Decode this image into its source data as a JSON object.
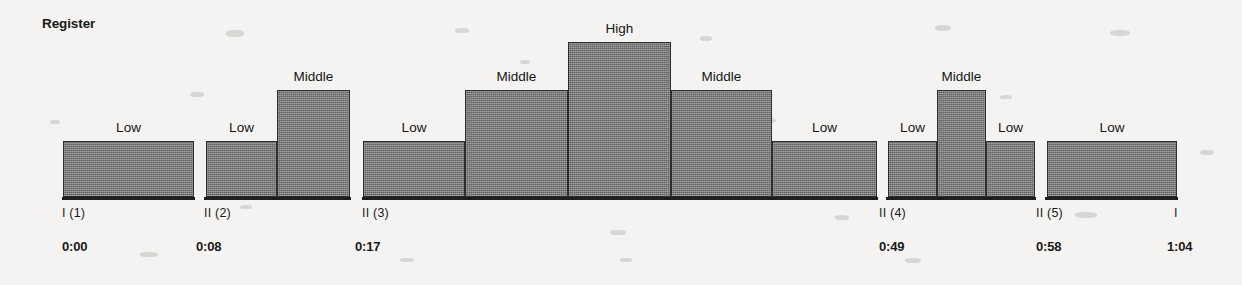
{
  "title": "Register",
  "chart_data": {
    "type": "bar",
    "title": "Register",
    "xlabel": "",
    "ylabel": "Register",
    "grid": false,
    "legend": "none",
    "level_scale": [
      "Low",
      "Middle",
      "High"
    ],
    "categories": [
      "I (1)",
      "II (2)",
      "II (3)",
      "II (4)",
      "II (5)",
      "I"
    ],
    "segments": [
      {
        "marker": "I (1)",
        "time": "0:00",
        "bars": [
          {
            "label": "Low",
            "level": 1
          }
        ]
      },
      {
        "marker": "II (2)",
        "time": "0:08",
        "bars": [
          {
            "label": "Low",
            "level": 1
          },
          {
            "label": "Middle",
            "level": 2
          }
        ]
      },
      {
        "marker": "II (3)",
        "time": "0:17",
        "bars": [
          {
            "label": "Low",
            "level": 1
          },
          {
            "label": "Middle",
            "level": 2
          },
          {
            "label": "High",
            "level": 3
          },
          {
            "label": "Middle",
            "level": 2
          },
          {
            "label": "Low",
            "level": 1
          }
        ]
      },
      {
        "marker": "II (4)",
        "time": "0:49",
        "bars": [
          {
            "label": "Low",
            "level": 1
          },
          {
            "label": "Middle",
            "level": 2
          },
          {
            "label": "Low",
            "level": 1
          }
        ]
      },
      {
        "marker": "II (5)",
        "time": "0:58",
        "bars": [
          {
            "label": "Low",
            "level": 1
          }
        ]
      },
      {
        "marker": "I",
        "time": "1:04",
        "bars": []
      }
    ],
    "bars_flat": [
      {
        "label": "Low",
        "level": 1,
        "x": 63,
        "w": 131
      },
      {
        "label": "Low",
        "level": 1,
        "x": 206,
        "w": 71
      },
      {
        "label": "Middle",
        "level": 2,
        "x": 277,
        "w": 73
      },
      {
        "label": "Low",
        "level": 1,
        "x": 363,
        "w": 102
      },
      {
        "label": "Middle",
        "level": 2,
        "x": 465,
        "w": 103
      },
      {
        "label": "High",
        "level": 3,
        "x": 568,
        "w": 103
      },
      {
        "label": "Middle",
        "level": 2,
        "x": 671,
        "w": 101
      },
      {
        "label": "Low",
        "level": 1,
        "x": 772,
        "w": 105
      },
      {
        "label": "Low",
        "level": 1,
        "x": 888,
        "w": 49
      },
      {
        "label": "Middle",
        "level": 2,
        "x": 937,
        "w": 49
      },
      {
        "label": "Low",
        "level": 1,
        "x": 986,
        "w": 49
      },
      {
        "label": "Low",
        "level": 1,
        "x": 1047,
        "w": 130
      }
    ],
    "baselines": [
      {
        "x": 62,
        "w": 133
      },
      {
        "x": 204,
        "w": 147
      },
      {
        "x": 362,
        "w": 516
      },
      {
        "x": 886,
        "w": 150
      },
      {
        "x": 1045,
        "w": 133
      }
    ],
    "ticks": [
      {
        "text": "I (1)",
        "x": 62
      },
      {
        "text": "II (2)",
        "x": 204
      },
      {
        "text": "II (3)",
        "x": 362
      },
      {
        "text": "II (4)",
        "x": 879
      },
      {
        "text": "II (5)",
        "x": 1036
      },
      {
        "text": "I",
        "x": 1174
      }
    ],
    "times": [
      {
        "text": "0:00",
        "x": 62
      },
      {
        "text": "0:08",
        "x": 196
      },
      {
        "text": "0:17",
        "x": 355
      },
      {
        "text": "0:49",
        "x": 879
      },
      {
        "text": "0:58",
        "x": 1036
      },
      {
        "text": "1:04",
        "x": 1167
      }
    ],
    "geometry": {
      "baseline_y": 197,
      "level_tops": {
        "1": 141,
        "2": 90,
        "3": 42
      },
      "label_row_y": 206,
      "time_row_y": 239
    }
  },
  "colors": {
    "background": "#f4f3f1",
    "bar_fill": "#7f7f7f",
    "bar_stroke": "#2e2e2e",
    "text": "#1a1a1a",
    "rule": "#1d1d1d"
  }
}
